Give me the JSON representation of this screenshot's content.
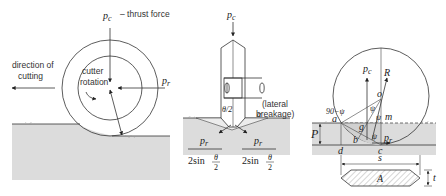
{
  "figure": {
    "panels": [
      {
        "id": "rolling-cutter",
        "labels": {
          "thrust": "p",
          "thrust_sub": "c",
          "thrust_desc": "– thrust force",
          "direction_line1": "direction of",
          "direction_line2": "cutting",
          "rotation_line1": "cutter",
          "rotation_line2": "rotation",
          "rolling_force": "p",
          "rolling_force_sub": "r"
        }
      },
      {
        "id": "wedge-indentation",
        "labels": {
          "thrust": "p",
          "thrust_sub": "c",
          "half_angle": "θ/2",
          "alpha": "α",
          "lateral_line1": "(lateral",
          "lateral_line2": "breakage)",
          "left_num": "p",
          "left_num_sub": "r",
          "left_den": "2sin",
          "left_den_frac_num": "θ",
          "left_den_frac_den": "2",
          "right_num": "p",
          "right_num_sub": "r",
          "right_den": "2sin",
          "right_den_frac_num": "θ",
          "right_den_frac_den": "2"
        }
      },
      {
        "id": "disc-geometry",
        "labels": {
          "thrust": "p",
          "thrust_sub": "c",
          "resultant": "R",
          "center": "o",
          "angle_ninety": "90−ψ",
          "point_a": "a",
          "point_b": "b",
          "point_c": "c",
          "point_d": "d",
          "point_g": "g",
          "point_m": "m",
          "psi_top": "ψ",
          "psi_mid": "ψ",
          "psi_low": "ψ",
          "rolling_force": "p",
          "rolling_force_sub": "r",
          "penetration": "P",
          "spacing": "s",
          "area": "A",
          "thickness": "t"
        }
      }
    ],
    "colors": {
      "ground_fill": "#dcdcdc",
      "line": "#333333",
      "background": "#ffffff"
    }
  }
}
